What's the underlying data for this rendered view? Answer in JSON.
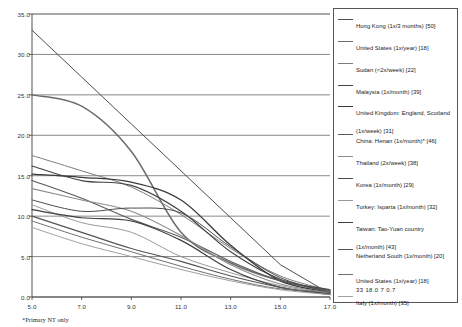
{
  "chart_data": {
    "type": "line",
    "title": "",
    "xlabel": "",
    "ylabel": "",
    "xlim": [
      5.0,
      17.0
    ],
    "ylim": [
      0.0,
      35.0
    ],
    "xticks": [
      "5.0",
      "7.0",
      "9.0",
      "11.0",
      "13.0",
      "15.0",
      "17.0"
    ],
    "yticks": [
      "0.0",
      "5.0",
      "10.0",
      "15.0",
      "20.0",
      "25.0",
      "30.0",
      "35.0"
    ],
    "grid": "horizontal",
    "legend_position": "right",
    "series": [
      {
        "name": "Hong Kong (1x/3 months) [50]",
        "color": "#4d4d4d",
        "width": 1.0,
        "x": [
          5.0,
          7.0,
          9.0,
          11.0,
          13.0,
          15.0,
          17.0
        ],
        "values": [
          33.0,
          27.2,
          21.4,
          15.6,
          9.8,
          4.0,
          0.4
        ]
      },
      {
        "name": "United States (1x/year) [18]",
        "color": "#6b6b6b",
        "width": 1.5,
        "x": [
          5.0,
          7.0,
          9.0,
          11.0,
          13.0,
          15.0,
          17.0
        ],
        "values": [
          25.0,
          23.6,
          18.0,
          8.0,
          4.2,
          2.0,
          0.7
        ]
      },
      {
        "name": "Sudan (<2x/week) [22]",
        "color": "#7d7d7d",
        "width": 1.0,
        "x": [
          5.0,
          7.0,
          9.0,
          11.0,
          13.0,
          15.0,
          17.0
        ],
        "values": [
          17.5,
          15.6,
          13.6,
          10.2,
          6.0,
          2.6,
          0.8
        ]
      },
      {
        "name": "Malaysia (1x/month) [39]",
        "color": "#444444",
        "width": 1.2,
        "x": [
          5.0,
          7.0,
          9.0,
          11.0,
          13.0,
          15.0,
          17.0
        ],
        "values": [
          16.2,
          14.4,
          13.8,
          10.6,
          5.6,
          2.2,
          0.9
        ]
      },
      {
        "name": "United Kingdom: England, Scotland (1x/week) [31]",
        "color": "#3a3a3a",
        "width": 1.3,
        "x": [
          5.0,
          7.0,
          9.0,
          11.0,
          13.0,
          15.0,
          17.0
        ],
        "values": [
          15.2,
          14.8,
          14.2,
          12.0,
          6.4,
          2.0,
          0.6
        ]
      },
      {
        "name": "China: Henan (1x/month)* [46]",
        "color": "#5a5a5a",
        "width": 1.1,
        "x": [
          5.0,
          7.0,
          9.0,
          11.0,
          13.0,
          15.0,
          17.0
        ],
        "values": [
          14.4,
          12.2,
          9.6,
          7.4,
          4.4,
          2.0,
          0.8
        ]
      },
      {
        "name": "Thailand (2x/week) [38]",
        "color": "#8c8c8c",
        "width": 1.1,
        "x": [
          5.0,
          7.0,
          9.0,
          11.0,
          13.0,
          15.0,
          17.0
        ],
        "values": [
          13.4,
          12.0,
          10.6,
          7.6,
          4.0,
          1.6,
          0.5
        ]
      },
      {
        "name": "Korea (1x/month) [29]",
        "color": "#4a4a4a",
        "width": 1.0,
        "x": [
          5.0,
          7.0,
          9.0,
          11.0,
          13.0,
          15.0,
          17.0
        ],
        "values": [
          12.0,
          10.6,
          11.0,
          10.4,
          6.2,
          2.4,
          0.6
        ]
      },
      {
        "name": "Turkey: Isparta (1x/month) [32]",
        "color": "#9a9a9a",
        "width": 1.0,
        "x": [
          5.0,
          7.0,
          9.0,
          11.0,
          13.0,
          15.0,
          17.0
        ],
        "values": [
          11.4,
          9.2,
          8.0,
          5.0,
          3.0,
          1.4,
          0.4
        ]
      },
      {
        "name": "Taiwan: Tao-Yuan country (1x/month) [43]",
        "color": "#3f3f3f",
        "width": 1.2,
        "x": [
          5.0,
          7.0,
          9.0,
          11.0,
          13.0,
          15.0,
          17.0
        ],
        "values": [
          10.8,
          9.8,
          9.4,
          7.0,
          3.4,
          1.2,
          0.4
        ]
      },
      {
        "name": "Netherland South (1x/month) [20]",
        "color": "#555555",
        "width": 1.2,
        "x": [
          5.0,
          7.0,
          9.0,
          11.0,
          13.0,
          15.0,
          17.0
        ],
        "values": [
          10.0,
          8.0,
          6.0,
          4.4,
          2.6,
          1.2,
          0.3
        ]
      },
      {
        "name": "United States (1x/year) [18]",
        "color": "#707070",
        "width": 1.0,
        "x": [
          5.0,
          7.0,
          9.0,
          11.0,
          13.0,
          15.0,
          17.0
        ],
        "values": [
          9.4,
          7.4,
          5.6,
          3.8,
          2.2,
          1.0,
          0.7
        ]
      },
      {
        "name": "Italy (1x/month) [35]",
        "color": "#a0a0a0",
        "width": 1.0,
        "x": [
          5.0,
          7.0,
          9.0,
          11.0,
          13.0,
          15.0,
          17.0
        ],
        "values": [
          8.6,
          6.6,
          5.0,
          3.4,
          2.0,
          0.9,
          0.3
        ]
      }
    ],
    "legend_entries": [
      {
        "label": "Hong Kong (1x/3 months) [50]",
        "color": "#4d4d4d",
        "width": 1.0,
        "sub": ""
      },
      {
        "label": "United States (1x/year) [18]",
        "color": "#6b6b6b",
        "width": 1.8,
        "sub": ""
      },
      {
        "label": "Sudan (<2x/week) [22]",
        "color": "#7d7d7d",
        "width": 1.0,
        "sub": ""
      },
      {
        "label": "Malaysia (1x/month) [39]",
        "color": "#444444",
        "width": 1.4,
        "sub": ""
      },
      {
        "label": "United Kingdom: England, Scotland (1x/week) [31]",
        "color": "#3a3a3a",
        "width": 1.4,
        "sub": ""
      },
      {
        "label": "China: Henan (1x/month)* [46]",
        "color": "#5a5a5a",
        "width": 1.1,
        "sub": ""
      },
      {
        "label": "Thailand (2x/week) [38]",
        "color": "#8c8c8c",
        "width": 1.4,
        "sub": ""
      },
      {
        "label": "Korea (1x/month) [29]",
        "color": "#4a4a4a",
        "width": 1.0,
        "sub": ""
      },
      {
        "label": "Turkey: Isparta (1x/month) [32]",
        "color": "#9a9a9a",
        "width": 1.0,
        "sub": ""
      },
      {
        "label": "Taiwan: Tao-Yuan country (1x/month) [43]",
        "color": "#3f3f3f",
        "width": 1.4,
        "sub": ""
      },
      {
        "label": "Netherland South (1x/month) [20]",
        "color": "#555555",
        "width": 1.4,
        "sub": ""
      },
      {
        "label": "United States (1x/year) [18]",
        "color": "#707070",
        "width": 1.0,
        "sub": "33 18.0 7 0.7"
      },
      {
        "label": "Italy (1x/month) [35]",
        "color": "#a0a0a0",
        "width": 1.0,
        "sub": ""
      }
    ]
  },
  "caption": {
    "text": "*Primary NT only"
  }
}
